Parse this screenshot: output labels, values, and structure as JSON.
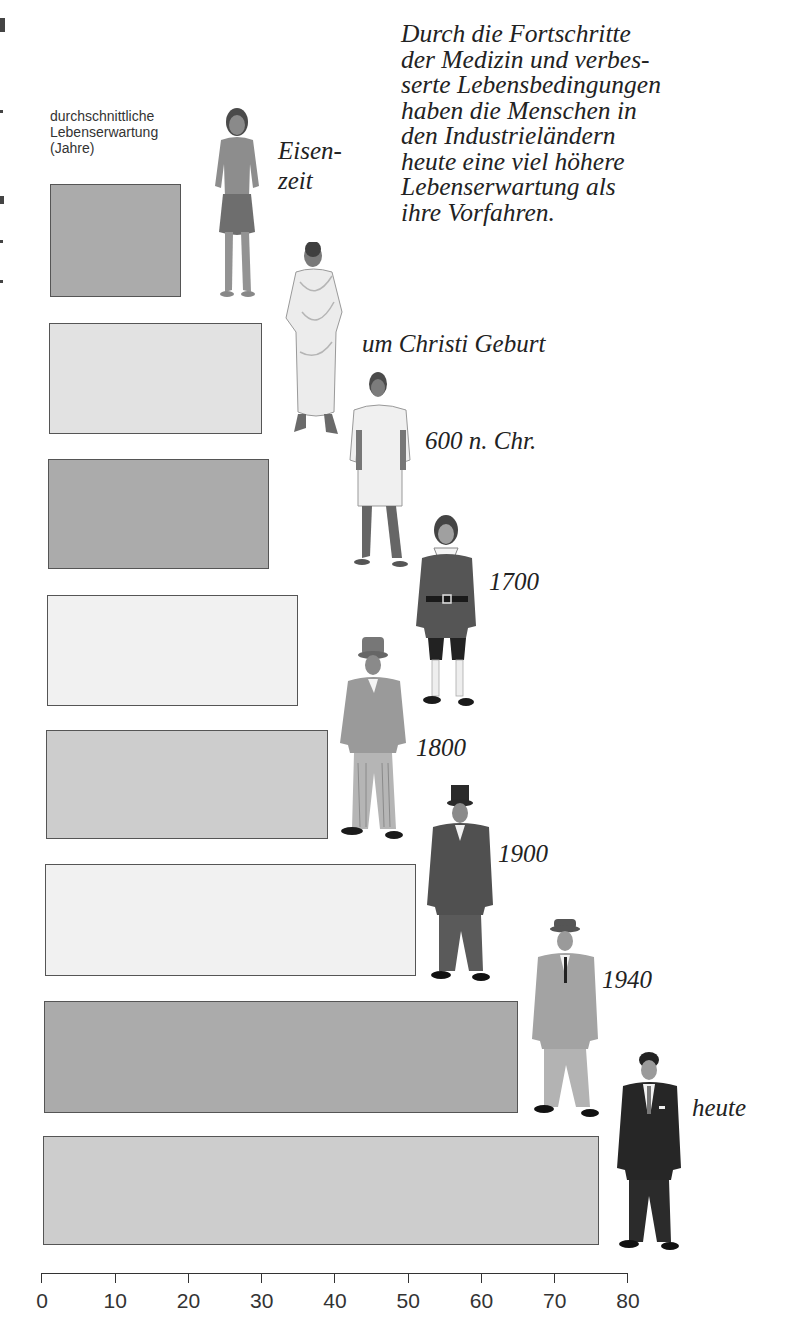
{
  "chart_data": {
    "type": "bar",
    "orientation": "horizontal",
    "title": "",
    "ylabel": "durchschnittliche Lebenserwartung (Jahre)",
    "xlabel": "",
    "categories": [
      "Eisenzeit",
      "um Christi Geburt",
      "600 n. Chr.",
      "1700",
      "1800",
      "1900",
      "1940",
      "heute"
    ],
    "values": [
      19,
      30,
      31,
      35,
      39,
      51,
      65,
      76
    ],
    "xlim": [
      0,
      80
    ],
    "xticks": [
      0,
      10,
      20,
      30,
      40,
      50,
      60,
      70,
      80
    ],
    "grid": false,
    "legend": null,
    "annotation": "Durch die Fortschritte der Medizin und verbesserte Lebensbedingungen haben die Menschen in den Industrieländern heute eine viel höhere Lebenserwartung als ihre Vorfahren."
  },
  "axis_label": {
    "lines": [
      "durchschnittliche",
      "Lebenserwartung",
      "(Jahre)"
    ]
  },
  "intro_text": {
    "lines": [
      "Durch die Fortschritte",
      "der Medizin und verbes-",
      "serte Lebensbedingungen",
      "haben die Menschen in",
      "den Industrieländern",
      "heute eine viel höhere",
      "Lebenserwartung als",
      "ihre Vorfahren."
    ]
  },
  "eras": [
    {
      "label_line1": "Eisen-",
      "label_line2": "zeit",
      "value": 19,
      "shade": "dark",
      "figure": "iron-age-man"
    },
    {
      "label_line1": "um Christi Geburt",
      "value": 30,
      "shade": "light",
      "figure": "roman-toga-man"
    },
    {
      "label_line1": "600 n. Chr.",
      "value": 31,
      "shade": "dark",
      "figure": "tunic-man"
    },
    {
      "label_line1": "1700",
      "value": 35,
      "shade": "pale",
      "figure": "18th-century-man"
    },
    {
      "label_line1": "1800",
      "value": 39,
      "shade": "mid",
      "figure": "19th-century-man"
    },
    {
      "label_line1": "1900",
      "value": 51,
      "shade": "pale",
      "figure": "top-hat-man"
    },
    {
      "label_line1": "1940",
      "value": 65,
      "shade": "dark",
      "figure": "fedora-man"
    },
    {
      "label_line1": "heute",
      "value": 76,
      "shade": "mid",
      "figure": "modern-suit-man"
    }
  ],
  "axis": {
    "ticks": [
      "0",
      "10",
      "20",
      "30",
      "40",
      "50",
      "60",
      "70",
      "80"
    ]
  },
  "colors": {
    "dark_bar": "#ababab",
    "mid_bar": "#cdcdcd",
    "light_bar": "#e2e2e2",
    "pale_bar": "#f1f1f1",
    "border": "#555555",
    "text": "#222222"
  }
}
